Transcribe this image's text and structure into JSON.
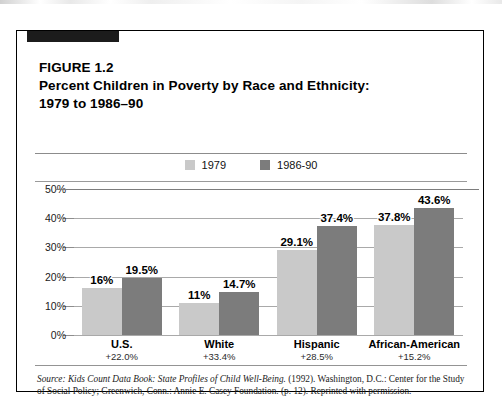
{
  "figure": {
    "title_lines": [
      "FIGURE 1.2",
      "Percent Children in Poverty by Race and Ethnicity:",
      "1979 to 1986–90"
    ],
    "corner_tab": "black-tab"
  },
  "colors": {
    "series_1979": "#c9c9c9",
    "series_1986_90": "#7c7c7c",
    "border": "#000000",
    "gridline": "#a9a9a9",
    "text": "#000000"
  },
  "source": {
    "label": "Source:",
    "italic_title": "Kids Count Data Book: State Profiles of Child Well-Being.",
    "rest": " (1992). Washington, D.C.: Center for the Study of Social Policy; Greenwich, Conn.: Annie E. Casey Foundation. (p. 12).  Reprinted with permission."
  },
  "chart_data": {
    "type": "bar",
    "title": "Percent Children in Poverty by Race and Ethnicity: 1979 to 1986–90",
    "xlabel": "",
    "ylabel": "",
    "ylim": [
      0,
      50
    ],
    "grid": true,
    "legend_position": "top-center",
    "ytick_labels": [
      "50%",
      "40%",
      "30%",
      "20%",
      "10%",
      "0%"
    ],
    "ytick_values": [
      50,
      40,
      30,
      20,
      10,
      0
    ],
    "categories": [
      "U.S.",
      "White",
      "Hispanic",
      "African-American"
    ],
    "category_changes": [
      "+22.0%",
      "+33.4%",
      "+28.5%",
      "+15.2%"
    ],
    "series": [
      {
        "name": "1979",
        "color": "#c9c9c9",
        "values": [
          16,
          11,
          29.1,
          37.8
        ],
        "labels": [
          "16%",
          "11%",
          "29.1%",
          "14.7%_placeholder"
        ]
      },
      {
        "name": "1986-90",
        "color": "#7c7c7c",
        "values": [
          19.5,
          14.7,
          37.4,
          43.6
        ],
        "labels": [
          "19.5%",
          "14.7%",
          "37.4%",
          "43.6%"
        ]
      }
    ],
    "bars": [
      {
        "category": "U.S.",
        "change": "+22.0%",
        "v1979": 16,
        "l1979": "16%",
        "v8690": 19.5,
        "l8690": "19.5%"
      },
      {
        "category": "White",
        "change": "+33.4%",
        "v1979": 11,
        "l1979": "11%",
        "v8690": 14.7,
        "l8690": "14.7%"
      },
      {
        "category": "Hispanic",
        "change": "+28.5%",
        "v1979": 29.1,
        "l1979": "29.1%",
        "v8690": 37.4,
        "l8690": "37.4%"
      },
      {
        "category": "African-American",
        "change": "+15.2%",
        "v1979": 37.8,
        "l1979": "37.8%",
        "v8690": 43.6,
        "l8690": "43.6%"
      }
    ]
  }
}
